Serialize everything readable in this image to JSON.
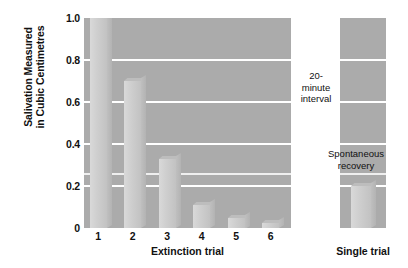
{
  "chart_data": {
    "type": "bar",
    "title": "",
    "ylabel_line1": "Salivation Measured",
    "ylabel_line2": "in Cubic Centimetres",
    "xlabel": "Extinction trial",
    "secondary_xlabel": "Single trial",
    "categories": [
      "1",
      "2",
      "3",
      "4",
      "5",
      "6"
    ],
    "values": [
      1.0,
      0.7,
      0.33,
      0.11,
      0.05,
      0.025
    ],
    "secondary_categories": [
      "Single trial"
    ],
    "secondary_values": [
      0.2
    ],
    "ylim": [
      0,
      1.0
    ],
    "yticks": [
      "0",
      "0.2",
      "0.4",
      "0.6",
      "0.8",
      "1.0"
    ],
    "ytick_values": [
      0,
      0.2,
      0.4,
      0.6,
      0.8,
      1.0
    ],
    "gridlines": [
      0.2,
      0.4,
      0.6,
      0.8
    ],
    "grid": true,
    "legend": "none",
    "annotations": [
      {
        "name": "interval",
        "text_lines": [
          "20-",
          "minute",
          "interval"
        ]
      },
      {
        "name": "spontaneous-recovery",
        "text_lines": [
          "Spontaneous",
          "recovery"
        ]
      }
    ],
    "colors": {
      "plot_background": "#ababab",
      "gridline": "#ffffff",
      "bar_fill": "#cfcfcf",
      "bar_side": "#b8b8b8",
      "text": "#111111",
      "page_background": "#ffffff"
    }
  },
  "annotations": {
    "interval": {
      "l1": "20-",
      "l2": "minute",
      "l3": "interval"
    },
    "recovery": {
      "l1": "Spontaneous",
      "l2": "recovery"
    }
  }
}
